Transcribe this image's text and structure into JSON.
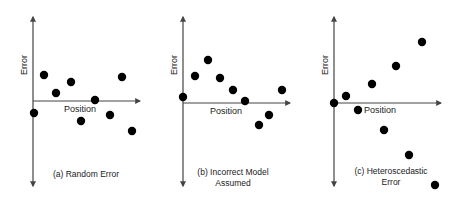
{
  "figure": {
    "colors": {
      "axis": "#444444",
      "dot": "#000000",
      "text": "#222222",
      "background": "#ffffff"
    },
    "panels": [
      {
        "id": "a",
        "caption_lines": [
          "(a) Random Error"
        ],
        "x_label": "Position",
        "y_label": "Error",
        "origin": [
          33,
          101
        ],
        "y_axis": [
          17,
          186
        ],
        "x_axis_end": 140,
        "x_label_pos": [
          64,
          112
        ],
        "caption_pos": [
          [
            86,
            177
          ]
        ],
        "points": [
          [
            34,
            113
          ],
          [
            44,
            75
          ],
          [
            56,
            93
          ],
          [
            71,
            82
          ],
          [
            81,
            121
          ],
          [
            95,
            100
          ],
          [
            110,
            115
          ],
          [
            122,
            77
          ],
          [
            132,
            131
          ]
        ]
      },
      {
        "id": "b",
        "caption_lines": [
          "(b) Incorrect Model",
          "Assumed"
        ],
        "x_label": "Position",
        "y_label": "Error",
        "origin": [
          183,
          103
        ],
        "y_axis": [
          17,
          186
        ],
        "x_axis_end": 290,
        "x_label_pos": [
          210,
          114
        ],
        "caption_pos": [
          [
            233,
            175
          ],
          [
            233,
            186
          ]
        ],
        "points": [
          [
            183,
            97
          ],
          [
            195,
            76
          ],
          [
            208,
            60
          ],
          [
            220,
            78
          ],
          [
            233,
            90
          ],
          [
            245,
            101
          ],
          [
            259,
            125
          ],
          [
            269,
            115
          ],
          [
            282,
            90
          ]
        ]
      },
      {
        "id": "c",
        "caption_lines": [
          "(c) Heteroscedastic",
          "Error"
        ],
        "x_label": "Position",
        "y_label": "Error",
        "origin": [
          334,
          103
        ],
        "y_axis": [
          17,
          186
        ],
        "x_axis_end": 441,
        "x_label_pos": [
          364,
          113
        ],
        "caption_pos": [
          [
            391,
            174
          ],
          [
            391,
            185
          ]
        ],
        "points": [
          [
            334,
            103
          ],
          [
            346,
            96
          ],
          [
            358,
            110
          ],
          [
            372,
            84
          ],
          [
            384,
            130
          ],
          [
            396,
            66
          ],
          [
            409,
            155
          ],
          [
            422,
            42
          ],
          [
            435,
            185
          ]
        ]
      }
    ]
  }
}
